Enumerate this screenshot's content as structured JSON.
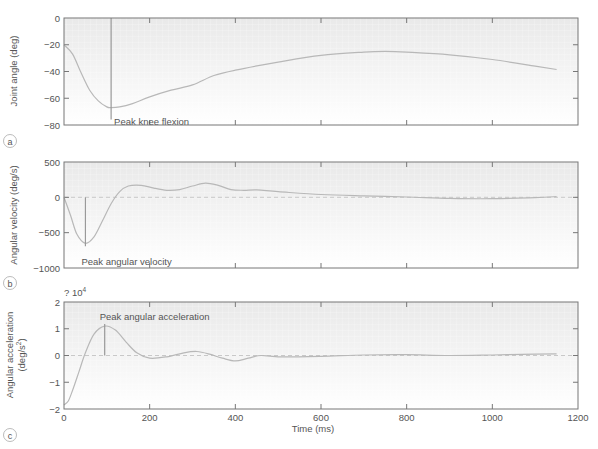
{
  "colors": {
    "curve": "#b8b8b8",
    "frame": "#777777",
    "text": "#555555",
    "zero_line": "#c8c8c8",
    "panel_fill_top": "#ebebeb",
    "panel_fill_bottom": "#ffffff"
  },
  "chart_data": [
    {
      "type": "line",
      "panel_label": "a",
      "title": "",
      "xlabel": "",
      "ylabel": "Joint angle (deg)",
      "xlim": [
        0,
        1200
      ],
      "ylim": [
        -80,
        0
      ],
      "yticks": [
        "0",
        "−20",
        "−40",
        "−60",
        "−80"
      ],
      "ytick_values": [
        0,
        -20,
        -40,
        -60,
        -80
      ],
      "xtick_values": [
        0,
        200,
        400,
        600,
        800,
        1000,
        1200
      ],
      "grid": false,
      "annotation": {
        "text": "Peak knee flexion",
        "x": 110,
        "y": -67
      },
      "x": [
        0,
        20,
        40,
        60,
        80,
        100,
        110,
        130,
        160,
        200,
        250,
        300,
        350,
        400,
        500,
        600,
        700,
        750,
        800,
        900,
        1000,
        1100,
        1150
      ],
      "y": [
        -20,
        -27,
        -41,
        -54,
        -62,
        -66.5,
        -67,
        -66.5,
        -64,
        -59,
        -54,
        -50,
        -43,
        -39,
        -33,
        -28,
        -25.5,
        -25,
        -25.5,
        -27.5,
        -31,
        -36,
        -38.5
      ]
    },
    {
      "type": "line",
      "panel_label": "b",
      "title": "",
      "xlabel": "",
      "ylabel": "Angular velocity (deg/s)",
      "xlim": [
        0,
        1200
      ],
      "ylim": [
        -1000,
        500
      ],
      "yticks": [
        "500",
        "0",
        "−500",
        "−1000"
      ],
      "ytick_values": [
        500,
        0,
        -500,
        -1000
      ],
      "xtick_values": [
        0,
        200,
        400,
        600,
        800,
        1000,
        1200
      ],
      "grid": false,
      "reference_line": 0,
      "annotation": {
        "text": "Peak angular velocity",
        "x": 50,
        "y": -650
      },
      "x": [
        0,
        15,
        30,
        50,
        70,
        90,
        110,
        130,
        150,
        180,
        210,
        240,
        270,
        300,
        330,
        360,
        390,
        420,
        450,
        500,
        600,
        700,
        800,
        900,
        1000,
        1100,
        1150
      ],
      "y": [
        0,
        -250,
        -520,
        -650,
        -560,
        -330,
        -90,
        80,
        160,
        170,
        130,
        100,
        110,
        160,
        200,
        170,
        110,
        100,
        105,
        80,
        40,
        20,
        5,
        -15,
        -20,
        -5,
        10
      ]
    },
    {
      "type": "line",
      "panel_label": "c",
      "title": "",
      "xlabel": "Time (ms)",
      "ylabel": "Angular acceleration (deg/s²)",
      "y_multiplier": "× 10^4",
      "xlim": [
        0,
        1200
      ],
      "ylim": [
        -2,
        2
      ],
      "yticks": [
        "2",
        "1",
        "0",
        "−1",
        "−2"
      ],
      "ytick_values": [
        2,
        1,
        0,
        -1,
        -2
      ],
      "xticks": [
        "0",
        "200",
        "400",
        "600",
        "800",
        "1000",
        "1200"
      ],
      "xtick_values": [
        0,
        200,
        400,
        600,
        800,
        1000,
        1200
      ],
      "grid": false,
      "reference_line": 0,
      "annotation": {
        "text": "Peak angular acceleration",
        "x": 95,
        "y": 1.1
      },
      "x": [
        0,
        10,
        20,
        35,
        50,
        70,
        95,
        120,
        145,
        170,
        200,
        240,
        280,
        310,
        340,
        370,
        400,
        430,
        460,
        500,
        600,
        700,
        800,
        900,
        1000,
        1100,
        1150
      ],
      "y": [
        -1.85,
        -1.7,
        -1.3,
        -0.6,
        0.1,
        0.8,
        1.1,
        0.95,
        0.5,
        0.1,
        -0.1,
        -0.05,
        0.1,
        0.15,
        0.05,
        -0.1,
        -0.2,
        -0.1,
        0.0,
        -0.05,
        -0.03,
        0.02,
        0.03,
        0.0,
        0.02,
        0.05,
        0.06
      ]
    }
  ],
  "labels": {
    "panel_a": "a",
    "panel_b": "b",
    "panel_c": "c",
    "ylabel_a": "Joint angle (deg)",
    "ylabel_b": "Angular velocity (deg/s)",
    "ylabel_c_line1": "Angular acceleration",
    "ylabel_c_line2": "(deg/s",
    "ylabel_c_sup": "2",
    "ylabel_c_close": ")",
    "multiplier_prefix": "? 10",
    "multiplier_exp": "4",
    "xlabel": "Time (ms)",
    "annot_a": "Peak knee flexion",
    "annot_b": "Peak angular velocity",
    "annot_c": "Peak angular acceleration",
    "yticks_a": [
      "0",
      "−20",
      "−40",
      "−60",
      "−80"
    ],
    "yticks_b": [
      "500",
      "0",
      "−500",
      "−1000"
    ],
    "yticks_c": [
      "2",
      "1",
      "0",
      "−1",
      "−2"
    ],
    "xticks": [
      "0",
      "200",
      "400",
      "600",
      "800",
      "1000",
      "1200"
    ]
  }
}
